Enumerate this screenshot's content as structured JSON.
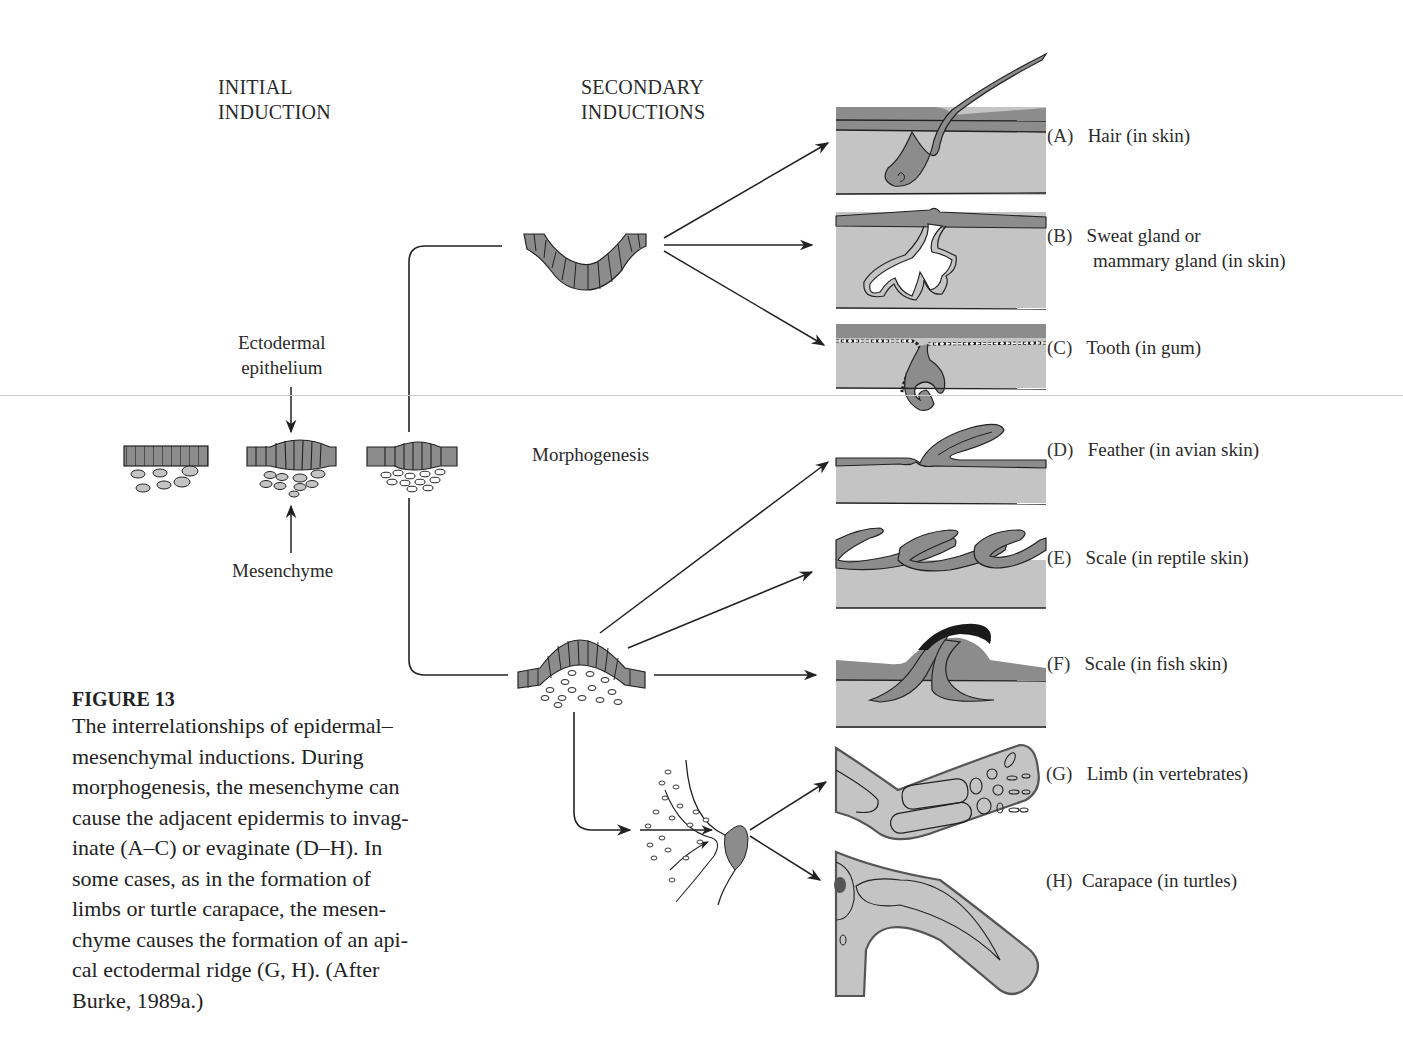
{
  "figure": {
    "headers": {
      "initial": [
        "INITIAL",
        "INDUCTION"
      ],
      "secondary": [
        "SECONDARY",
        "INDUCTIONS"
      ]
    },
    "labels": {
      "ectodermal": [
        "Ectodermal",
        "epithelium"
      ],
      "mesenchyme": "Mesenchyme",
      "morphogenesis": "Morphogenesis"
    },
    "panels": [
      {
        "letter": "(A)",
        "text": [
          "Hair (in skin)"
        ]
      },
      {
        "letter": "(B)",
        "text": [
          "Sweat gland or",
          "mammary gland (in skin)"
        ]
      },
      {
        "letter": "(C)",
        "text": [
          "Tooth (in gum)"
        ]
      },
      {
        "letter": "(D)",
        "text": [
          "Feather (in avian skin)"
        ]
      },
      {
        "letter": "(E)",
        "text": [
          "Scale (in reptile skin)"
        ]
      },
      {
        "letter": "(F)",
        "text": [
          "Scale (in fish skin)"
        ]
      },
      {
        "letter": "(G)",
        "text": [
          "Limb (in vertebrates)"
        ]
      },
      {
        "letter": "(H)",
        "text": [
          "Carapace (in turtles)"
        ]
      }
    ],
    "colors": {
      "epithelium": "#8c8c8c",
      "dermis": "#c4c4c4",
      "ink": "#222222",
      "dark_scale": "#1a1a1a"
    }
  },
  "caption": {
    "title": "FIGURE 13",
    "lines": [
      "The interrelationships of epidermal–",
      "mesenchymal inductions. During",
      "morphogenesis, the mesenchyme can",
      "cause the adjacent epidermis to invag-",
      "inate (A–C) or evaginate (D–H). In",
      "some cases, as in the formation of",
      "limbs or turtle carapace, the mesen-",
      "chyme causes the formation of an api-",
      "cal ectodermal ridge (G, H). (After",
      "Burke, 1989a.)"
    ]
  }
}
